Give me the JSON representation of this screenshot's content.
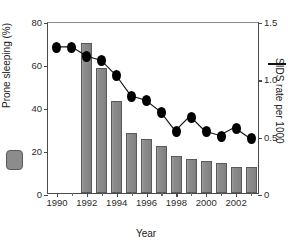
{
  "chart_data": {
    "type": "bar",
    "title": "",
    "subtitle": "",
    "xlabel": "Year",
    "ylabel": "Prone sleeping (%)",
    "ylabel_right": "SIDS rate per 1000",
    "xlim": [
      1989.4,
      2003.6
    ],
    "ylim": [
      0,
      80
    ],
    "ylim_right": [
      0,
      1.5
    ],
    "grid": false,
    "legend_position": "left-and-right-axis-markers",
    "x_tick_labels": [
      "1990",
      "1992",
      "1994",
      "1996",
      "1998",
      "2000",
      "2002"
    ],
    "x_tick_values": [
      1990,
      1992,
      1994,
      1996,
      1998,
      2000,
      2002
    ],
    "x_minor_ticks": [
      1991,
      1993,
      1995,
      1997,
      1999,
      2001,
      2003
    ],
    "y_tick_labels": [
      "0",
      "20",
      "40",
      "60",
      "80"
    ],
    "y_tick_values": [
      0,
      20,
      40,
      60,
      80
    ],
    "y_right_tick_labels": [
      "0",
      "0.5",
      "1.0",
      "1.5"
    ],
    "y_right_tick_values": [
      0,
      0.5,
      1.0,
      1.5
    ],
    "categories": [
      1990,
      1991,
      1992,
      1993,
      1994,
      1995,
      1996,
      1997,
      1998,
      1999,
      2000,
      2001,
      2002,
      2003
    ],
    "series": [
      {
        "name": "Prone sleeping (%)",
        "type": "bar",
        "axis": "left",
        "color": "#8c8c8c",
        "values": [
          null,
          null,
          70,
          58,
          43,
          28,
          25,
          22,
          17,
          16,
          15,
          14,
          12,
          12
        ]
      },
      {
        "name": "SIDS rate per 1000",
        "type": "line",
        "axis": "right",
        "color": "#000000",
        "values": [
          1.29,
          1.29,
          1.21,
          1.17,
          1.04,
          0.86,
          0.82,
          0.72,
          0.55,
          0.68,
          0.55,
          0.51,
          0.58,
          0.49
        ]
      }
    ]
  },
  "legend": {
    "bar_swatch_name": "prone-sleeping-bars",
    "line_mark_name": "sids-rate-line"
  }
}
